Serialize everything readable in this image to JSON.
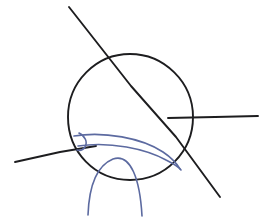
{
  "figure": {
    "canvas": {
      "width": 271,
      "height": 220,
      "background": "#ffffff"
    },
    "colors": {
      "ink_black": "#1d1d1f",
      "ink_blue": "#5c6aa0",
      "background": "#ffffff"
    },
    "elements": {
      "circle": {
        "name": "main circle",
        "center_x": 130,
        "center_y": 117,
        "radius": 63,
        "color": "#1d1d1f",
        "stroke_width": 1.9,
        "path": "M 130 54 C 164 54 193 82 193 117 C 193 152 165 180 130 180 C 95 180 68 152 68 117 C 68 82 96 54 130 54 Z"
      },
      "steep_line": {
        "name": "steep diagonal chord",
        "start_x": 69,
        "start_y": 7,
        "end_x": 220,
        "end_y": 197,
        "color": "#1d1d1f",
        "stroke_width": 1.9,
        "path": "M 69 7 L 131 86 L 176 137 L 220 197"
      },
      "shallow_line": {
        "name": "shallow left secant",
        "start_x": 15,
        "start_y": 162,
        "end_x": 96,
        "end_y": 147,
        "color": "#1d1d1f",
        "stroke_width": 1.9,
        "path": "M 15 162 L 60 152 L 96 146"
      },
      "horizontal_line": {
        "name": "horizontal right ray",
        "start_x": 168,
        "start_y": 118,
        "end_x": 258,
        "end_y": 116,
        "color": "#1d1d1f",
        "stroke_width": 1.9,
        "path": "M 168 118 L 215 117 L 258 116"
      },
      "blue_arc_outer": {
        "name": "outer blue arc",
        "start_x": 74,
        "start_y": 136,
        "end_x": 180,
        "end_y": 168,
        "color": "#5c6aa0",
        "stroke_width": 1.6,
        "path": "M 74 136 C 104 131 142 138 163 152 C 172 158 177 164 180 169"
      },
      "blue_arc_inner": {
        "name": "inner blue arc",
        "start_x": 78,
        "start_y": 146,
        "end_x": 181,
        "end_y": 170,
        "color": "#5c6aa0",
        "stroke_width": 1.6,
        "path": "M 78 146 C 110 141 146 149 166 160 C 174 164 179 167 181 170"
      },
      "blue_small_arc": {
        "name": "small blue arc with legs",
        "apex_x": 115,
        "apex_y": 159,
        "left_leg_x": 88,
        "left_leg_y": 215,
        "right_leg_x": 142,
        "right_leg_y": 216,
        "color": "#5c6aa0",
        "stroke_width": 1.6,
        "path": "M 88 215 C 89 188 96 166 113 159 C 131 153 140 180 142 216"
      },
      "angle_marker": {
        "name": "angle marker hook at left vertex",
        "vertex_x": 80,
        "vertex_y": 137,
        "color": "#5c6aa0",
        "stroke_width": 1.6,
        "path": "M 79 133 C 85 136 88 142 85 147 C 83 150 80 151 77 150"
      }
    },
    "labels": []
  }
}
